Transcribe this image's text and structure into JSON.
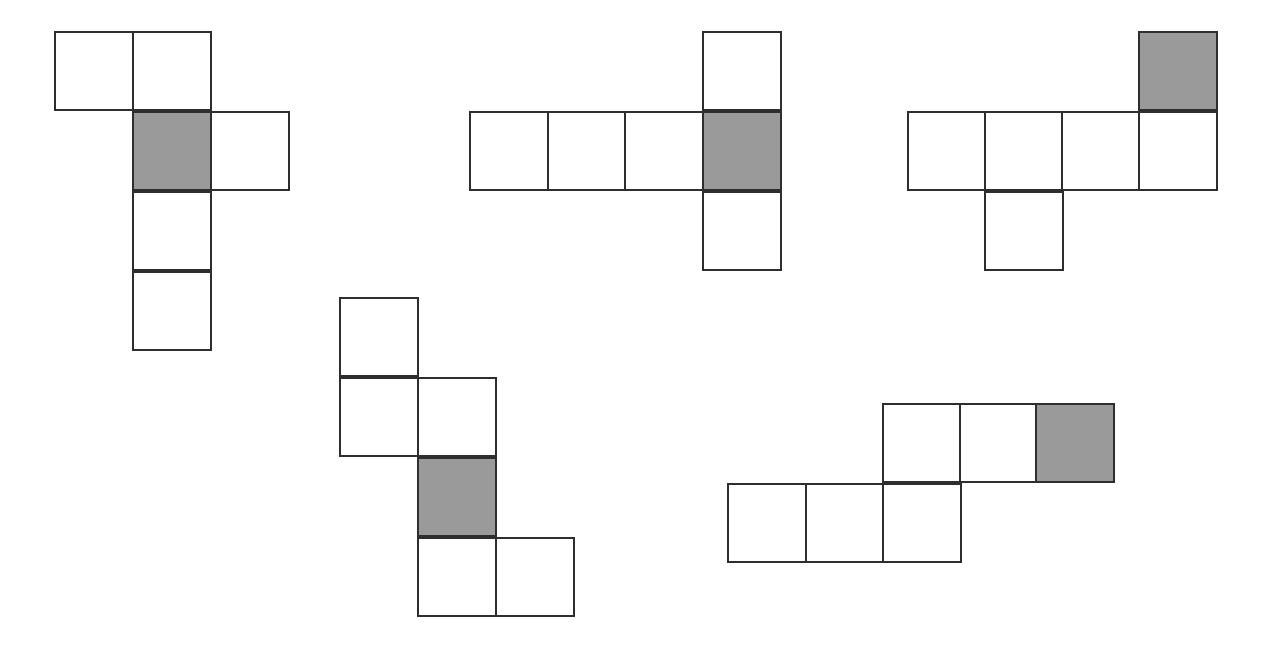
{
  "diagram": {
    "type": "cube-nets",
    "cell_size": 80,
    "colors": {
      "stroke": "#2e2e2e",
      "face": "#ffffff",
      "shaded_face": "#9a9a9a",
      "background": "#ffffff"
    },
    "nets": [
      {
        "id": "net-1",
        "cells": [
          {
            "x": 54,
            "y": 31,
            "shaded": false
          },
          {
            "x": 132,
            "y": 31,
            "shaded": false
          },
          {
            "x": 132,
            "y": 111,
            "shaded": true
          },
          {
            "x": 210,
            "y": 111,
            "shaded": false
          },
          {
            "x": 132,
            "y": 191,
            "shaded": false
          },
          {
            "x": 132,
            "y": 271,
            "shaded": false
          }
        ]
      },
      {
        "id": "net-2",
        "cells": [
          {
            "x": 702,
            "y": 31,
            "shaded": false
          },
          {
            "x": 469,
            "y": 111,
            "shaded": false
          },
          {
            "x": 547,
            "y": 111,
            "shaded": false
          },
          {
            "x": 624,
            "y": 111,
            "shaded": false
          },
          {
            "x": 702,
            "y": 111,
            "shaded": true
          },
          {
            "x": 702,
            "y": 191,
            "shaded": false
          }
        ]
      },
      {
        "id": "net-3",
        "cells": [
          {
            "x": 1138,
            "y": 31,
            "shaded": true
          },
          {
            "x": 907,
            "y": 111,
            "shaded": false
          },
          {
            "x": 984,
            "y": 111,
            "shaded": false
          },
          {
            "x": 1061,
            "y": 111,
            "shaded": false
          },
          {
            "x": 1138,
            "y": 111,
            "shaded": false
          },
          {
            "x": 984,
            "y": 191,
            "shaded": false
          }
        ]
      },
      {
        "id": "net-4",
        "cells": [
          {
            "x": 339,
            "y": 297,
            "shaded": false
          },
          {
            "x": 339,
            "y": 377,
            "shaded": false
          },
          {
            "x": 417,
            "y": 377,
            "shaded": false
          },
          {
            "x": 417,
            "y": 457,
            "shaded": true
          },
          {
            "x": 417,
            "y": 537,
            "shaded": false
          },
          {
            "x": 495,
            "y": 537,
            "shaded": false
          }
        ]
      },
      {
        "id": "net-5",
        "cells": [
          {
            "x": 882,
            "y": 403,
            "shaded": false
          },
          {
            "x": 959,
            "y": 403,
            "shaded": false
          },
          {
            "x": 1035,
            "y": 403,
            "shaded": true
          },
          {
            "x": 727,
            "y": 483,
            "shaded": false
          },
          {
            "x": 805,
            "y": 483,
            "shaded": false
          },
          {
            "x": 882,
            "y": 483,
            "shaded": false
          }
        ]
      }
    ]
  }
}
